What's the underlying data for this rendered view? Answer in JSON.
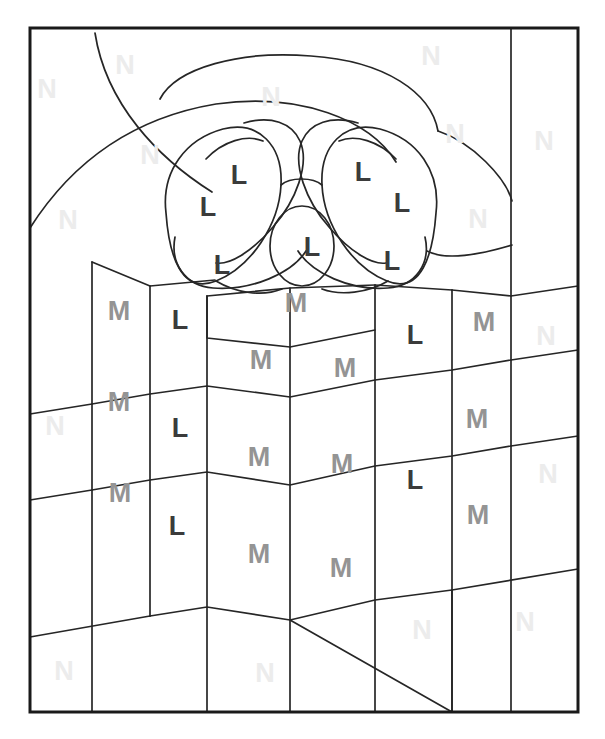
{
  "page": {
    "type": "color-by-letter-coloring-page",
    "width": 605,
    "height": 739,
    "background_color": "#ffffff",
    "border_color": "#1a1a1a",
    "outline_color": "#262626"
  },
  "legend": {
    "codes": [
      {
        "letter": "L",
        "color_hex": "#3b3b3b",
        "region": "bow-ribbon"
      },
      {
        "letter": "M",
        "color_hex": "#949494",
        "region": "gift-box"
      },
      {
        "letter": "N",
        "color_hex": "#ececec",
        "region": "background"
      }
    ]
  },
  "letters": [
    {
      "id": "n-01",
      "letter": "N",
      "x": 47,
      "y": 91
    },
    {
      "id": "n-02",
      "letter": "N",
      "x": 125,
      "y": 67
    },
    {
      "id": "n-03",
      "letter": "N",
      "x": 271,
      "y": 99
    },
    {
      "id": "n-04",
      "letter": "N",
      "x": 431,
      "y": 58
    },
    {
      "id": "n-05",
      "letter": "N",
      "x": 455,
      "y": 136
    },
    {
      "id": "n-06",
      "letter": "N",
      "x": 544,
      "y": 143
    },
    {
      "id": "n-07",
      "letter": "N",
      "x": 150,
      "y": 157
    },
    {
      "id": "n-08",
      "letter": "N",
      "x": 68,
      "y": 222
    },
    {
      "id": "n-09",
      "letter": "N",
      "x": 478,
      "y": 221
    },
    {
      "id": "n-10",
      "letter": "N",
      "x": 546,
      "y": 338
    },
    {
      "id": "n-11",
      "letter": "N",
      "x": 55,
      "y": 428
    },
    {
      "id": "n-12",
      "letter": "N",
      "x": 548,
      "y": 476
    },
    {
      "id": "n-13",
      "letter": "N",
      "x": 422,
      "y": 632
    },
    {
      "id": "n-14",
      "letter": "N",
      "x": 525,
      "y": 624
    },
    {
      "id": "n-15",
      "letter": "N",
      "x": 64,
      "y": 673
    },
    {
      "id": "n-16",
      "letter": "N",
      "x": 265,
      "y": 675
    },
    {
      "id": "l-01",
      "letter": "L",
      "x": 239,
      "y": 177
    },
    {
      "id": "l-02",
      "letter": "L",
      "x": 363,
      "y": 174
    },
    {
      "id": "l-03",
      "letter": "L",
      "x": 208,
      "y": 209
    },
    {
      "id": "l-04",
      "letter": "L",
      "x": 402,
      "y": 205
    },
    {
      "id": "l-05",
      "letter": "L",
      "x": 312,
      "y": 249
    },
    {
      "id": "l-06",
      "letter": "L",
      "x": 222,
      "y": 267
    },
    {
      "id": "l-07",
      "letter": "L",
      "x": 392,
      "y": 263
    },
    {
      "id": "l-08",
      "letter": "L",
      "x": 180,
      "y": 322
    },
    {
      "id": "l-09",
      "letter": "L",
      "x": 415,
      "y": 337
    },
    {
      "id": "l-10",
      "letter": "L",
      "x": 180,
      "y": 430
    },
    {
      "id": "l-11",
      "letter": "L",
      "x": 415,
      "y": 482
    },
    {
      "id": "l-12",
      "letter": "L",
      "x": 177,
      "y": 528
    },
    {
      "id": "m-01",
      "letter": "M",
      "x": 296,
      "y": 305
    },
    {
      "id": "m-02",
      "letter": "M",
      "x": 119,
      "y": 313
    },
    {
      "id": "m-03",
      "letter": "M",
      "x": 484,
      "y": 324
    },
    {
      "id": "m-04",
      "letter": "M",
      "x": 261,
      "y": 362
    },
    {
      "id": "m-05",
      "letter": "M",
      "x": 345,
      "y": 370
    },
    {
      "id": "m-06",
      "letter": "M",
      "x": 119,
      "y": 404
    },
    {
      "id": "m-07",
      "letter": "M",
      "x": 477,
      "y": 421
    },
    {
      "id": "m-08",
      "letter": "M",
      "x": 259,
      "y": 459
    },
    {
      "id": "m-09",
      "letter": "M",
      "x": 342,
      "y": 466
    },
    {
      "id": "m-10",
      "letter": "M",
      "x": 120,
      "y": 495
    },
    {
      "id": "m-11",
      "letter": "M",
      "x": 478,
      "y": 517
    },
    {
      "id": "m-12",
      "letter": "M",
      "x": 259,
      "y": 556
    },
    {
      "id": "m-13",
      "letter": "M",
      "x": 341,
      "y": 570
    }
  ],
  "paths": {
    "frame": "M 30 28 L 578 28 L 578 712 L 30 712 Z",
    "background_lines": [
      "M 511 28 L 511 712",
      "M 511 296 L 578 286",
      "M 30 414 L 93 404",
      "M 30 490 L 150 470",
      "M 92 262 L 92 712",
      "M 30 637 L 150 616 L 452 712",
      "M 452 608 L 511 598",
      "M 452 598 L 452 712",
      "M 511 446 L 578 436"
    ],
    "bow_paths": [
      "M 95 33 C 108 100 160 155 215 190",
      "M 30 228 C 70 160 130 117 215 103 C 300 90 370 118 395 160",
      "M 160 98 C 175 68 240 50 310 55 C 385 60 430 92 437 130",
      "M 225 127 C 253 105 290 100 310 108",
      "M 165 212 C 160 170 185 138 222 128 C 258 119 282 145 280 184 C 278 224 250 266 215 280 C 180 294 168 254 165 212 Z",
      "M 205 158 C 222 140 246 133 262 140",
      "M 243 122 C 270 114 291 122 299 140 C 309 163 295 200 272 226 C 250 252 228 264 215 262",
      "M 175 236 C 170 262 184 285 212 287 C 250 290 290 272 305 250",
      "M 435 213 C 440 171 416 139 380 128 C 344 118 320 145 322 184 C 324 224 352 266 387 280 C 420 294 432 254 435 213 Z",
      "M 396 158 C 380 140 356 133 340 140",
      "M 358 122 C 331 114 310 122 302 140 C 292 163 306 200 329 226 C 351 252 373 264 386 262",
      "M 425 236 C 430 262 416 285 388 287 C 350 290 312 272 297 250",
      "M 290 213 C 290 184 301 213 301 213",
      "M 282 244 m -32 0 a 32 39 0 1 0 64 0 a 32 39 0 1 0 -64 0",
      "M 437 130 C 470 140 505 176 511 200",
      "M 511 244 C 470 256 440 258 425 250",
      "M 280 184 C 290 176 312 176 322 184",
      "M 215 280 C 235 292 270 296 290 288",
      "M 312 288 C 330 295 368 292 387 280"
    ],
    "box_paths": [
      "M 92 262 L 92 712",
      "M 150 286 L 150 616",
      "M 150 286 L 215 280",
      "M 207 296 L 207 712",
      "M 207 296 L 290 288",
      "M 290 288 L 290 712",
      "M 290 288 L 375 285",
      "M 375 285 L 375 712",
      "M 375 285 L 452 290",
      "M 452 290 L 452 712",
      "M 452 290 L 511 296",
      "M 207 296 L 290 288 L 375 285 L 375 330 L 290 347 L 207 338 Z",
      "M 290 347 L 290 712",
      "M 207 338 L 290 347 L 375 330",
      "M 92 404 L 150 394 L 207 386 L 290 397 L 375 380 L 452 370 L 511 360",
      "M 92 490 L 150 480 L 207 472 L 290 485 L 375 466 L 452 456 L 511 446",
      "M 92 490 L 30 500",
      "M 150 616 L 207 607 L 290 620 L 375 600 L 452 590",
      "M 150 616 L 30 637",
      "M 290 620 L 452 712",
      "M 511 296 L 578 286",
      "M 511 360 L 578 350",
      "M 511 446 L 578 436",
      "M 452 590 L 578 569"
    ]
  }
}
